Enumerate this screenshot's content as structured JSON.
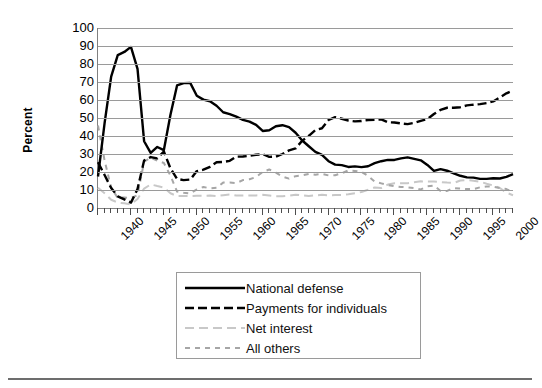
{
  "axes": {
    "ylabel": "Percent",
    "yticks": [
      "100",
      "90",
      "80",
      "70",
      "60",
      "50",
      "40",
      "30",
      "20",
      "10",
      "0"
    ],
    "xticks": [
      "1940",
      "1945",
      "1950",
      "1955",
      "1960",
      "1965",
      "1970",
      "1975",
      "1980",
      "1985",
      "1990",
      "1995",
      "2000"
    ]
  },
  "legend": {
    "items": [
      {
        "label": "National defense",
        "key": "solid-black-line",
        "color": "#000000"
      },
      {
        "label": "Payments for individuals",
        "key": "dashed-black-line",
        "color": "#000000"
      },
      {
        "label": "Net interest",
        "key": "dashed-lightgray-line",
        "color": "#c8c8c8"
      },
      {
        "label": "All others",
        "key": "dotted-gray-line",
        "color": "#a6a6a6"
      }
    ]
  },
  "chart_data": {
    "type": "line",
    "title": "",
    "xlabel": "",
    "ylabel": "Percent",
    "xlim": [
      1940,
      2003
    ],
    "ylim": [
      0,
      100
    ],
    "grid": true,
    "legend_position": "below-plot",
    "x": [
      1940,
      1941,
      1942,
      1943,
      1944,
      1945,
      1946,
      1947,
      1948,
      1949,
      1950,
      1951,
      1952,
      1953,
      1954,
      1955,
      1956,
      1957,
      1958,
      1959,
      1960,
      1961,
      1962,
      1963,
      1964,
      1965,
      1966,
      1967,
      1968,
      1969,
      1970,
      1971,
      1972,
      1973,
      1974,
      1975,
      1976,
      1977,
      1978,
      1979,
      1980,
      1981,
      1982,
      1983,
      1984,
      1985,
      1986,
      1987,
      1988,
      1989,
      1990,
      1991,
      1992,
      1993,
      1994,
      1995,
      1996,
      1997,
      1998,
      1999,
      2000,
      2001,
      2002,
      2003
    ],
    "series": [
      {
        "name": "National defense",
        "style": "solid",
        "color": "#000000",
        "values": [
          17.5,
          47.1,
          73.0,
          84.9,
          86.7,
          89.5,
          77.3,
          37.1,
          30.6,
          33.9,
          32.2,
          51.8,
          68.1,
          69.4,
          69.5,
          62.4,
          60.2,
          59.3,
          56.8,
          53.2,
          52.2,
          50.8,
          49.0,
          48.0,
          46.2,
          42.8,
          43.2,
          45.4,
          46.0,
          44.9,
          41.8,
          37.5,
          34.3,
          31.2,
          29.5,
          26.0,
          24.1,
          23.8,
          22.8,
          23.1,
          22.7,
          23.2,
          24.9,
          26.0,
          26.7,
          26.7,
          27.6,
          28.1,
          27.3,
          26.5,
          23.9,
          20.6,
          21.6,
          20.7,
          19.3,
          17.9,
          17.0,
          16.9,
          16.2,
          16.2,
          16.5,
          16.4,
          17.3,
          18.8
        ]
      },
      {
        "name": "Payments for individuals",
        "style": "dashed",
        "color": "#000000",
        "values": [
          25.4,
          18.3,
          11.1,
          6.5,
          4.8,
          3.0,
          10.5,
          26.4,
          28.3,
          27.6,
          31.4,
          22.0,
          16.2,
          15.5,
          15.8,
          20.5,
          21.3,
          22.9,
          25.4,
          25.6,
          26.2,
          28.5,
          28.6,
          29.0,
          29.6,
          29.9,
          28.4,
          28.5,
          30.0,
          32.0,
          33.1,
          37.4,
          40.1,
          43.3,
          44.3,
          48.9,
          50.5,
          49.6,
          48.6,
          48.1,
          48.3,
          48.9,
          49.0,
          49.2,
          47.6,
          47.5,
          47.0,
          46.6,
          47.3,
          48.4,
          49.4,
          52.2,
          54.5,
          55.7,
          55.7,
          56.0,
          57.0,
          57.4,
          57.7,
          58.3,
          59.2,
          61.4,
          63.7,
          65.2
        ]
      },
      {
        "name": "Net interest",
        "style": "dashed-light",
        "color": "#c8c8c8",
        "values": [
          11.3,
          8.2,
          4.6,
          3.0,
          2.6,
          2.0,
          5.0,
          10.8,
          13.1,
          12.2,
          11.4,
          8.2,
          6.6,
          6.6,
          6.6,
          6.8,
          6.8,
          6.9,
          6.6,
          7.1,
          7.5,
          6.9,
          6.9,
          7.0,
          7.0,
          7.3,
          7.0,
          6.5,
          6.5,
          6.8,
          7.4,
          7.0,
          6.7,
          7.0,
          7.3,
          7.0,
          7.2,
          7.3,
          7.7,
          8.2,
          8.9,
          10.1,
          11.4,
          11.1,
          13.0,
          13.7,
          13.7,
          13.8,
          14.3,
          14.8,
          14.7,
          14.7,
          14.4,
          14.1,
          13.9,
          15.3,
          15.5,
          15.2,
          14.6,
          13.5,
          12.5,
          11.1,
          8.5,
          7.1
        ]
      },
      {
        "name": "All others",
        "style": "dotted",
        "color": "#a6a6a6",
        "values": [
          45.8,
          26.4,
          11.3,
          5.6,
          5.9,
          5.5,
          7.2,
          25.7,
          28.0,
          26.3,
          25.0,
          18.0,
          9.1,
          8.5,
          8.1,
          10.3,
          11.7,
          10.9,
          11.2,
          14.1,
          14.1,
          13.8,
          15.5,
          16.0,
          17.2,
          20.0,
          21.4,
          19.6,
          17.5,
          16.3,
          17.7,
          18.1,
          18.9,
          18.5,
          18.9,
          18.1,
          18.2,
          19.3,
          20.9,
          20.6,
          20.1,
          17.8,
          14.7,
          13.7,
          12.7,
          12.1,
          11.7,
          11.5,
          11.1,
          10.3,
          12.0,
          12.5,
          9.5,
          9.5,
          11.1,
          10.8,
          10.5,
          10.5,
          11.5,
          12.0,
          11.8,
          11.1,
          10.5,
          8.9
        ]
      }
    ]
  }
}
